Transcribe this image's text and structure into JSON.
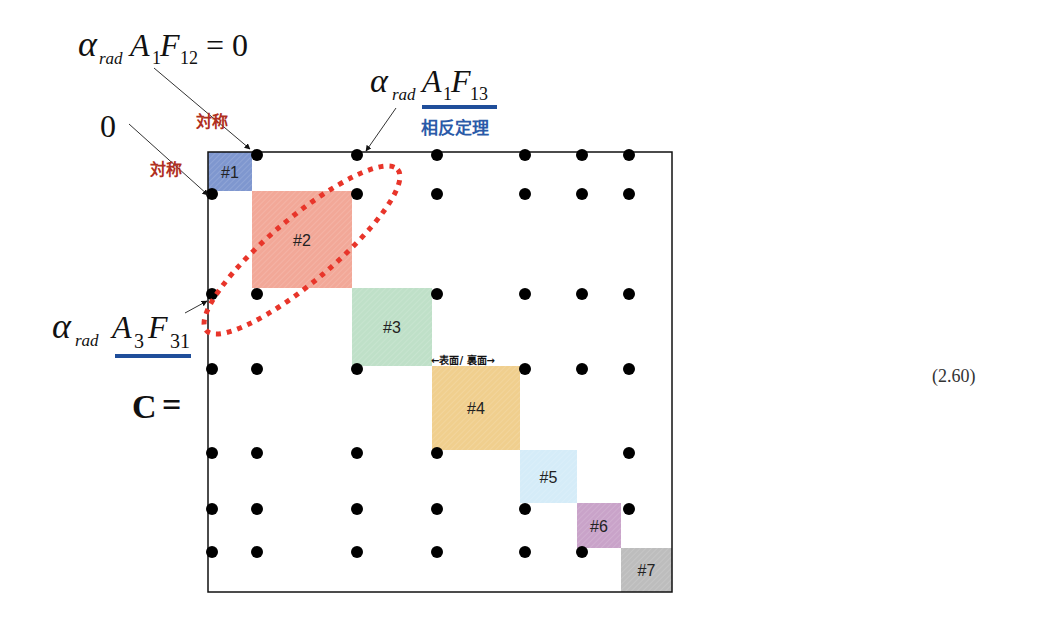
{
  "equation_number": "(2.60)",
  "matrix_symbol": "C",
  "equals": "=",
  "annotations": {
    "top_left_formula": {
      "alpha": "α",
      "sub1": "rad",
      "A": "A",
      "A_sub": "1",
      "F": "F",
      "F_sub": "12",
      "tail": "= 0"
    },
    "top_right_formula": {
      "alpha": "α",
      "sub1": "rad",
      "A": "A",
      "A_sub": "1",
      "F": "F",
      "F_sub": "13"
    },
    "left_formula": {
      "alpha": "α",
      "sub1": "rad",
      "A": "A",
      "A_sub": "3",
      "F": "F",
      "F_sub": "31"
    },
    "zero_label": "0",
    "symmetry_label_top": "対称",
    "symmetry_label_left": "対称",
    "reciprocity_label": "相反定理",
    "surface_label": "←表面/ 裏面→"
  },
  "blocks": [
    {
      "label": "#1",
      "color": "#7f97cf"
    },
    {
      "label": "#2",
      "color": "#f2a898"
    },
    {
      "label": "#3",
      "color": "#bfe0c8"
    },
    {
      "label": "#4",
      "color": "#f0cf8e"
    },
    {
      "label": "#5",
      "color": "#d5ecf8"
    },
    {
      "label": "#6",
      "color": "#c9a3c9"
    },
    {
      "label": "#7",
      "color": "#bdbdbd"
    }
  ],
  "nonzero_entries": [
    [
      1,
      2
    ],
    [
      1,
      3
    ],
    [
      1,
      4
    ],
    [
      1,
      5
    ],
    [
      1,
      6
    ],
    [
      1,
      7
    ],
    [
      2,
      1
    ],
    [
      2,
      3
    ],
    [
      2,
      4
    ],
    [
      2,
      5
    ],
    [
      2,
      6
    ],
    [
      2,
      7
    ],
    [
      3,
      1
    ],
    [
      3,
      2
    ],
    [
      3,
      4
    ],
    [
      3,
      5
    ],
    [
      3,
      6
    ],
    [
      3,
      7
    ],
    [
      4,
      1
    ],
    [
      4,
      2
    ],
    [
      4,
      3
    ],
    [
      4,
      5
    ],
    [
      4,
      6
    ],
    [
      4,
      7
    ],
    [
      5,
      1
    ],
    [
      5,
      2
    ],
    [
      5,
      3
    ],
    [
      5,
      4
    ],
    [
      5,
      7
    ],
    [
      6,
      1
    ],
    [
      6,
      2
    ],
    [
      6,
      3
    ],
    [
      6,
      4
    ],
    [
      6,
      5
    ],
    [
      6,
      7
    ],
    [
      7,
      1
    ],
    [
      7,
      2
    ],
    [
      7,
      3
    ],
    [
      7,
      4
    ],
    [
      7,
      5
    ],
    [
      7,
      6
    ]
  ],
  "colors": {
    "annotation_red": "#b03020",
    "reciprocity_blue": "#2a5aa8",
    "underline_blue": "#1f4e9a",
    "ellipse_red": "#e8352a"
  }
}
